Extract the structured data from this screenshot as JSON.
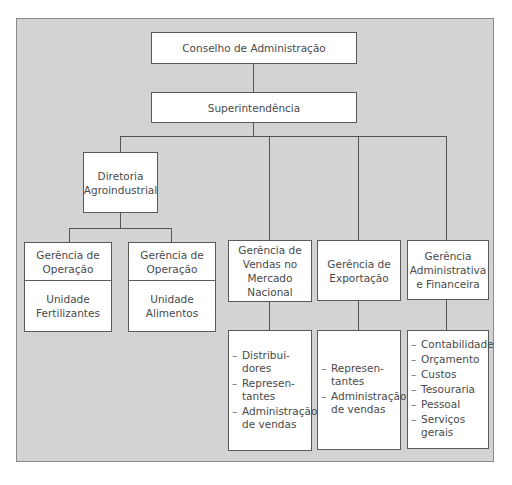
{
  "diagram": {
    "type": "org-chart",
    "language": "pt-BR",
    "colors": {
      "background": "#d3d3d3",
      "box_fill": "#ffffff",
      "line": "#555555",
      "text": "#4a4a4a"
    },
    "nodes": {
      "board": {
        "label": "Conselho de Administração"
      },
      "superintendence": {
        "label": "Superintendência"
      },
      "agro_director": {
        "lines": [
          "Diretoria",
          "Agroindustrial"
        ]
      },
      "ops_fert": {
        "title": [
          "Gerência de",
          "Operação"
        ],
        "unit": [
          "Unidade",
          "Fertilizantes"
        ]
      },
      "ops_food": {
        "title": [
          "Gerência de",
          "Operação"
        ],
        "unit": [
          "Unidade",
          "Alimentos"
        ]
      },
      "sales": {
        "title": [
          "Gerência de",
          "Vendas no",
          "Mercado",
          "Nacional"
        ],
        "items": [
          [
            "Distribui-",
            "dores"
          ],
          [
            "Represen-",
            "tantes"
          ],
          [
            "Administração",
            "de vendas"
          ]
        ]
      },
      "export": {
        "title": [
          "Gerência de",
          "Exportação"
        ],
        "items": [
          [
            "Represen-",
            "tantes"
          ],
          [
            "Administração",
            "de vendas"
          ]
        ]
      },
      "admin_fin": {
        "title": [
          "Gerência",
          "Administrativa",
          "e Financeira"
        ],
        "items": [
          [
            "Contabilidade"
          ],
          [
            "Orçamento"
          ],
          [
            "Custos"
          ],
          [
            "Tesouraria"
          ],
          [
            "Pessoal"
          ],
          [
            "Serviços",
            "gerais"
          ]
        ]
      }
    },
    "edges": [
      [
        "board",
        "superintendence"
      ],
      [
        "superintendence",
        "agro_director"
      ],
      [
        "superintendence",
        "sales"
      ],
      [
        "superintendence",
        "export"
      ],
      [
        "superintendence",
        "admin_fin"
      ],
      [
        "agro_director",
        "ops_fert"
      ],
      [
        "agro_director",
        "ops_food"
      ]
    ]
  }
}
